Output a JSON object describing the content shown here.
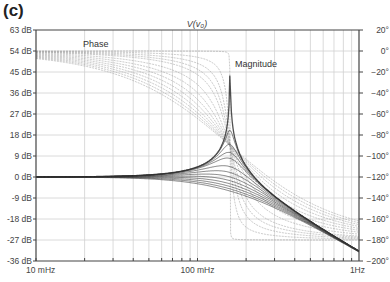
{
  "panel_label": "(c)",
  "chart_data": {
    "type": "line",
    "title": "V(v₀)",
    "xlabel": "Frequency",
    "x_scale": "log",
    "x_range_hz": [
      0.01,
      1
    ],
    "x_tick_labels": [
      "10 mHz",
      "100 mHz",
      "1Hz"
    ],
    "y_left": {
      "label": "Magnitude (dB)",
      "range": [
        -36,
        63
      ],
      "step": 9,
      "tick_labels": [
        "63 dB",
        "54 dB",
        "45 dB",
        "36 dB",
        "27 dB",
        "18 dB",
        "9 dB",
        "0 dB",
        "-9 dB",
        "-18 dB",
        "-27 dB",
        "-36 dB"
      ]
    },
    "y_right": {
      "label": "Phase (degrees)",
      "range": [
        -200,
        20
      ],
      "step": 20,
      "tick_labels": [
        "20°",
        "0°",
        "−20°",
        "−40°",
        "−60°",
        "−80°",
        "−100°",
        "−120°",
        "−140°",
        "−160°",
        "−180°",
        "−200°"
      ]
    },
    "annotations": [
      {
        "text": "Phase",
        "near": "upper-left phase curves"
      },
      {
        "text": "Magnitude",
        "near": "resonant peak"
      }
    ],
    "grid": true,
    "resonance_frequency_hz": 0.159,
    "series_magnitude": [
      {
        "name": "zeta=0.001",
        "peak_db": 60
      },
      {
        "name": "zeta=0.05",
        "peak_db": 20
      },
      {
        "name": "zeta=0.1",
        "peak_db": 14
      },
      {
        "name": "zeta=0.15",
        "peak_db": 10.5
      },
      {
        "name": "zeta=0.2",
        "peak_db": 8
      },
      {
        "name": "zeta=0.3",
        "peak_db": 4.5
      },
      {
        "name": "zeta=0.4",
        "peak_db": 2
      },
      {
        "name": "zeta=0.5",
        "peak_db": 0
      },
      {
        "name": "zeta=0.6",
        "peak_db": -1.6
      },
      {
        "name": "zeta=0.7",
        "peak_db": -3
      },
      {
        "name": "zeta=0.8",
        "peak_db": -4
      },
      {
        "name": "zeta=0.9",
        "peak_db": -5.1
      },
      {
        "name": "zeta=1.0",
        "peak_db": -6
      }
    ],
    "endpoint_values": {
      "magnitude_at_10mHz_db": 0,
      "magnitude_at_1Hz_db": -32,
      "phase_at_10mHz_deg": -5,
      "phase_at_1Hz_deg": -180
    }
  },
  "colors": {
    "axis": "#444444",
    "grid": "#d0d0d0",
    "magnitude": "#333333",
    "phase": "#9a9a9a"
  }
}
